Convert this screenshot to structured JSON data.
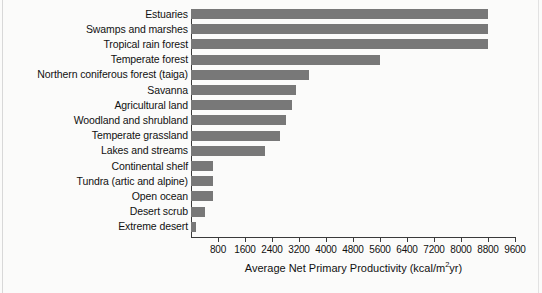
{
  "chart_data": {
    "type": "bar",
    "orientation": "horizontal",
    "title": "",
    "xlabel": "Average Net Primary Productivity (kcal/m²yr)",
    "ylabel": "",
    "xlim": [
      0,
      9600
    ],
    "grid": false,
    "legend": null,
    "bar_color": "#787878",
    "xticks": [
      800,
      1600,
      2400,
      3200,
      4000,
      4800,
      5600,
      6400,
      7200,
      8000,
      8800,
      9600
    ],
    "xtick_labels": [
      "800",
      "1600",
      "2400",
      "3200",
      "4000",
      "4800",
      "5600",
      "6400",
      "7200",
      "8000",
      "8800",
      "9600"
    ],
    "categories": [
      "Estuaries",
      "Swamps and marshes",
      "Tropical rain forest",
      "Temperate forest",
      "Northern coniferous forest (taiga)",
      "Savanna",
      "Agricultural land",
      "Woodland and shrubland",
      "Temperate grassland",
      "Lakes and streams",
      "Continental shelf",
      "Tundra (artic and alpine)",
      "Open ocean",
      "Desert scrub",
      "Extreme desert"
    ],
    "values": [
      8800,
      8800,
      8800,
      5600,
      3500,
      3100,
      3000,
      2800,
      2650,
      2200,
      650,
      650,
      650,
      400,
      150
    ]
  },
  "axis_title_parts": {
    "before": "Average Net Primary Productivity (kcal/m",
    "sup": "2",
    "after": "yr)"
  }
}
